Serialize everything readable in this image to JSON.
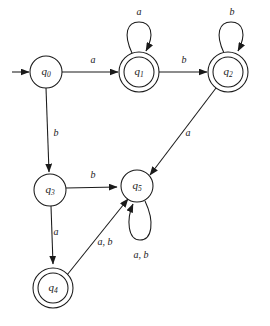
{
  "diagram": {
    "type": "finite-state-automaton",
    "title": "",
    "width": 270,
    "height": 326,
    "background_color": "#ffffff",
    "stroke_color": "#1a1a1a",
    "alphabet": [
      "a",
      "b"
    ],
    "start_state": "q0",
    "accepting_states": [
      "q1",
      "q2",
      "q4"
    ],
    "states": [
      {
        "id": "q0",
        "name": "q",
        "subscript": "0",
        "label": "q0",
        "x": 46,
        "y": 72,
        "radius": 16,
        "accepting": false,
        "is_start": true
      },
      {
        "id": "q1",
        "name": "q",
        "subscript": "1",
        "label": "q1",
        "x": 139,
        "y": 72,
        "radius": 20,
        "inner_radius": 15,
        "accepting": true,
        "is_start": false
      },
      {
        "id": "q2",
        "name": "q",
        "subscript": "2",
        "label": "q2",
        "x": 228,
        "y": 72,
        "radius": 20,
        "inner_radius": 15,
        "accepting": true,
        "is_start": false
      },
      {
        "id": "q3",
        "name": "q",
        "subscript": "3",
        "label": "q3",
        "x": 50,
        "y": 190,
        "radius": 16,
        "accepting": false,
        "is_start": false
      },
      {
        "id": "q4",
        "name": "q",
        "subscript": "4",
        "label": "q4",
        "x": 53,
        "y": 288,
        "radius": 20,
        "inner_radius": 15,
        "accepting": true,
        "is_start": false
      },
      {
        "id": "q5",
        "name": "q",
        "subscript": "5",
        "label": "q5",
        "x": 137,
        "y": 186,
        "radius": 16,
        "accepting": false,
        "is_start": false
      }
    ],
    "transitions": [
      {
        "id": "start-arrow",
        "from": null,
        "to": "q0",
        "label": "",
        "kind": "start",
        "label_x": 0,
        "label_y": 0
      },
      {
        "id": "q0-q1",
        "from": "q0",
        "to": "q1",
        "label": "a",
        "kind": "straight",
        "label_x": 93,
        "label_y": 61
      },
      {
        "id": "q1-q1",
        "from": "q1",
        "to": "q1",
        "label": "a",
        "kind": "self-loop-top",
        "label_x": 139,
        "label_y": 13
      },
      {
        "id": "q1-q2",
        "from": "q1",
        "to": "q2",
        "label": "b",
        "kind": "straight",
        "label_x": 184,
        "label_y": 61
      },
      {
        "id": "q2-q2",
        "from": "q2",
        "to": "q2",
        "label": "b",
        "kind": "self-loop-top",
        "label_x": 232,
        "label_y": 13
      },
      {
        "id": "q0-q3",
        "from": "q0",
        "to": "q3",
        "label": "b",
        "kind": "straight",
        "label_x": 54,
        "label_y": 134
      },
      {
        "id": "q2-q5",
        "from": "q2",
        "to": "q5",
        "label": "a",
        "kind": "diagonal",
        "label_x": 187,
        "label_y": 134
      },
      {
        "id": "q3-q5",
        "from": "q3",
        "to": "q5",
        "label": "b",
        "kind": "straight",
        "label_x": 93,
        "label_y": 176
      },
      {
        "id": "q3-q4",
        "from": "q3",
        "to": "q4",
        "label": "a",
        "kind": "straight",
        "label_x": 54,
        "label_y": 233
      },
      {
        "id": "q4-q5",
        "from": "q4",
        "to": "q5",
        "label": "a, b",
        "kind": "diagonal",
        "label_x": 104,
        "label_y": 243
      },
      {
        "id": "q5-q5",
        "from": "q5",
        "to": "q5",
        "label": "a, b",
        "kind": "self-loop-bottom",
        "label_x": 140,
        "label_y": 256
      }
    ]
  }
}
